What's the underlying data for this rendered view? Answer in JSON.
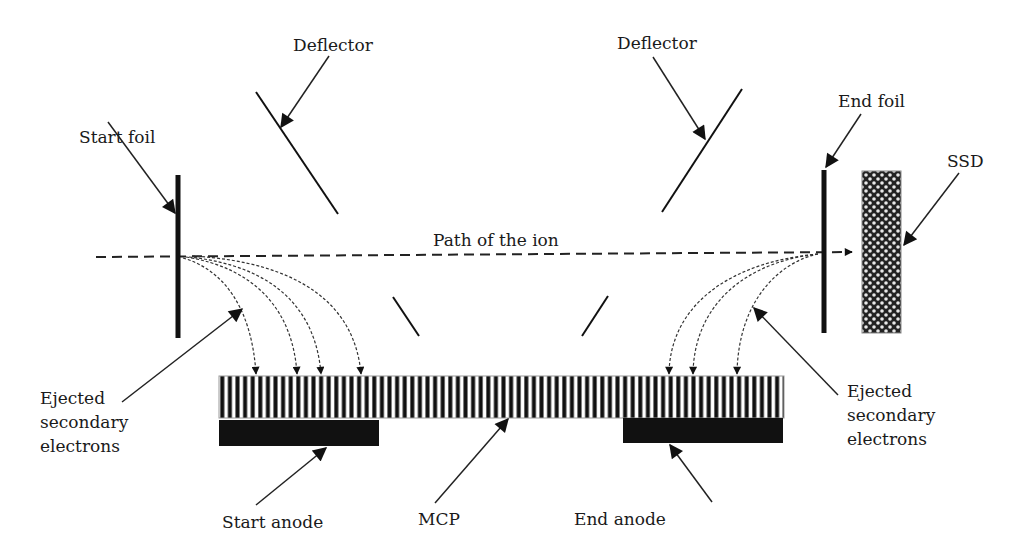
{
  "diagram": {
    "type": "time-of-flight ion detector schematic",
    "labels": {
      "start_foil": "Start foil",
      "deflector_left": "Deflector",
      "deflector_right": "Deflector",
      "end_foil": "End foil",
      "ssd": "SSD",
      "ion_path": "Path of the ion",
      "ejected_left": [
        "Ejected",
        "secondary",
        "electrons"
      ],
      "ejected_right": [
        "Ejected",
        "secondary",
        "electrons"
      ],
      "start_anode": "Start anode",
      "mcp": "MCP",
      "end_anode": "End anode"
    },
    "components": [
      {
        "id": "start-foil",
        "kind": "foil"
      },
      {
        "id": "deflector-left",
        "kind": "deflector"
      },
      {
        "id": "deflector-right",
        "kind": "deflector"
      },
      {
        "id": "end-foil",
        "kind": "foil"
      },
      {
        "id": "ssd",
        "kind": "solid-state detector"
      },
      {
        "id": "mcp",
        "kind": "microchannel plate"
      },
      {
        "id": "start-anode",
        "kind": "anode"
      },
      {
        "id": "end-anode",
        "kind": "anode"
      }
    ],
    "colors": {
      "ink": "#111111",
      "background": "#ffffff"
    }
  }
}
